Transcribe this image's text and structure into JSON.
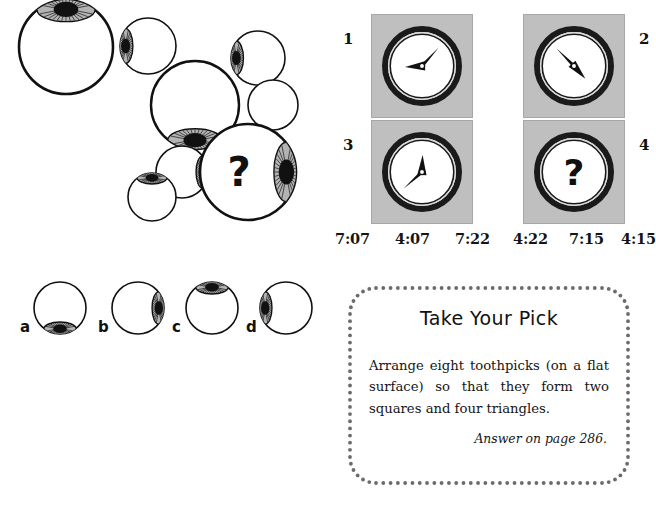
{
  "page": {
    "background_color": "#ffffff",
    "ink_color": "#111111"
  },
  "eyeball_puzzle": {
    "name": "eyeball-cluster-puzzle",
    "question_mark": "?",
    "cluster": {
      "description": "Cluster of overlapping eyeballs, one marked with a question mark",
      "eyeballs": [
        {
          "id": "eye-1",
          "cx": 66,
          "cy": 47,
          "r": 47,
          "iris": "top",
          "iris_scale": 1.0
        },
        {
          "id": "eye-2",
          "cx": 148,
          "cy": 46,
          "r": 28,
          "iris": "left",
          "iris_scale": 0.62
        },
        {
          "id": "eye-3",
          "cx": 258,
          "cy": 58,
          "r": 27,
          "iris": "left",
          "iris_scale": 0.6
        },
        {
          "id": "eye-4",
          "cx": 273,
          "cy": 105,
          "r": 25,
          "iris": "none",
          "iris_scale": 0.0
        },
        {
          "id": "eye-5",
          "cx": 195,
          "cy": 105,
          "r": 44,
          "iris": "bottom",
          "iris_scale": 0.95
        },
        {
          "id": "eye-6",
          "cx": 182,
          "cy": 172,
          "r": 26,
          "iris": "right",
          "iris_scale": 0.58
        },
        {
          "id": "eye-7",
          "cx": 152,
          "cy": 197,
          "r": 24,
          "iris": "top",
          "iris_scale": 0.55
        },
        {
          "id": "eye-8",
          "cx": 248,
          "cy": 172,
          "r": 48,
          "iris": "right",
          "iris_scale": 1.02
        }
      ],
      "question_eye_id": "eye-8"
    },
    "options": {
      "name": "answer-options",
      "items": [
        {
          "label": "a",
          "iris": "bottom",
          "cx": 52,
          "cy": 40,
          "r": 26
        },
        {
          "label": "b",
          "iris": "right",
          "cx": 130,
          "cy": 40,
          "r": 26
        },
        {
          "label": "c",
          "iris": "top",
          "cx": 204,
          "cy": 40,
          "r": 26
        },
        {
          "label": "d",
          "iris": "left",
          "cx": 278,
          "cy": 40,
          "r": 26
        }
      ]
    },
    "colors": {
      "iris_gray": "#b3b3b3",
      "pupil": "#111111",
      "outline": "#111111"
    }
  },
  "clock_puzzle": {
    "name": "clock-sequence-puzzle",
    "panel_color": "#bfbfbf",
    "cells": [
      {
        "number": "1",
        "number_side": "left",
        "hour_angle": 267,
        "minute_angle": 42,
        "has_question": false
      },
      {
        "number": "2",
        "number_side": "right",
        "hour_angle": 138,
        "minute_angle": 315,
        "has_question": false
      },
      {
        "number": "3",
        "number_side": "left",
        "hour_angle": 2,
        "minute_angle": 228,
        "has_question": false
      },
      {
        "number": "4",
        "number_side": "right",
        "hour_angle": 0,
        "minute_angle": 0,
        "has_question": true
      }
    ],
    "question_mark": "?",
    "time_options": [
      "7:07",
      "4:07",
      "7:22",
      "4:22",
      "7:15",
      "4:15"
    ]
  },
  "take_your_pick": {
    "name": "take-your-pick-box",
    "title": "Take Your Pick",
    "body": "Arrange eight toothpicks (on a flat surface) so that they form two squares and four triangles.",
    "answer_note": "Answer on page 286.",
    "border_style": "dotted",
    "border_color": "#6b6b6b"
  }
}
